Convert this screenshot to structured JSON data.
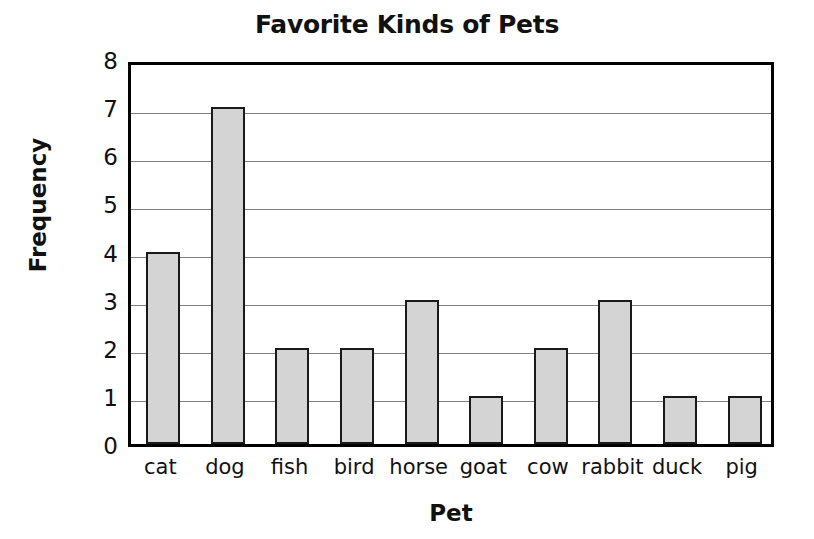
{
  "chart_data": {
    "type": "bar",
    "title": "Favorite Kinds of Pets",
    "xlabel": "Pet",
    "ylabel": "Frequency",
    "categories": [
      "cat",
      "dog",
      "fish",
      "bird",
      "horse",
      "goat",
      "cow",
      "rabbit",
      "duck",
      "pig"
    ],
    "values": [
      4,
      7,
      2,
      2,
      3,
      1,
      2,
      3,
      1,
      1
    ],
    "ylim": [
      0,
      8
    ],
    "ytick_labels": [
      "0",
      "1",
      "2",
      "3",
      "4",
      "5",
      "6",
      "7",
      "8"
    ],
    "ytick_values": [
      0,
      1,
      2,
      3,
      4,
      5,
      6,
      7,
      8
    ],
    "grid": true,
    "grid_axis": "y",
    "legend": false,
    "legend_position": "none",
    "bar_fill_color": "#d4d4d4",
    "bar_edge_color": "#1a1a1a",
    "grid_color": "#808080",
    "axis_color": "#000000",
    "background_color": "#ffffff"
  }
}
